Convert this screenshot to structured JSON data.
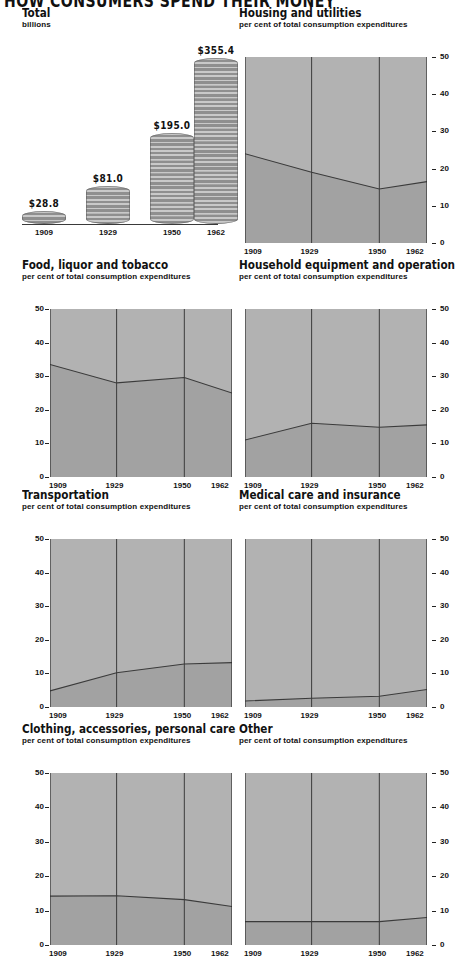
{
  "title": "HOW CONSUMERS SPEND THEIR MONEY",
  "colors": {
    "upper_area": "#b2b2b2",
    "lower_area": "#a2a2a2",
    "line": "#3b3b3b",
    "axis": "#2a2a2a",
    "coin_light": "#c9c9c9",
    "coin_dark": "#8f8f8f",
    "background": "#ffffff"
  },
  "axis": {
    "y_ticks": [
      "0",
      "10",
      "20",
      "30",
      "40",
      "50"
    ],
    "y_min": 0,
    "y_max": 50,
    "x_labels": [
      "1909",
      "1929",
      "1950",
      "1962"
    ],
    "subtitle": "per cent of total consumption expenditures"
  },
  "chart_data": [
    {
      "type": "bar",
      "title": "Total",
      "subtitle": "billions",
      "ylabel": "billions",
      "xlabel": "",
      "categories": [
        "1909",
        "1929",
        "1950",
        "1962"
      ],
      "values": [
        28.8,
        81.0,
        195.0,
        355.4
      ],
      "value_labels": [
        "$28.8",
        "$81.0",
        "$195.0",
        "$355.4"
      ],
      "ylim": [
        0,
        380
      ],
      "grid": false,
      "legend": "none",
      "style": "coin-stack"
    },
    {
      "type": "area",
      "title": "Housing and utilities",
      "subtitle": "per cent of total consumption expenditures",
      "xlabel": "",
      "ylabel": "per cent of total consumption expenditures",
      "x": [
        "1909",
        "1929",
        "1950",
        "1962"
      ],
      "values": [
        24.0,
        19.0,
        14.5,
        16.5
      ],
      "ylim": [
        0,
        50
      ],
      "yticks": [
        0,
        10,
        20,
        30,
        40,
        50
      ],
      "grid": true,
      "legend": "none",
      "axis_side": "right"
    },
    {
      "type": "area",
      "title": "Food, liquor and tobacco",
      "subtitle": "per cent of total consumption expenditures",
      "xlabel": "",
      "ylabel": "per cent of total consumption expenditures",
      "x": [
        "1909",
        "1929",
        "1950",
        "1962"
      ],
      "values": [
        33.5,
        28.0,
        29.6,
        25.0
      ],
      "ylim": [
        0,
        50
      ],
      "yticks": [
        0,
        10,
        20,
        30,
        40,
        50
      ],
      "grid": true,
      "legend": "none",
      "axis_side": "left"
    },
    {
      "type": "area",
      "title": "Household equipment and operation",
      "subtitle": "per cent of total consumption expenditures",
      "xlabel": "",
      "ylabel": "per cent of total consumption expenditures",
      "x": [
        "1909",
        "1929",
        "1950",
        "1962"
      ],
      "values": [
        11.0,
        16.0,
        14.8,
        15.5
      ],
      "ylim": [
        0,
        50
      ],
      "yticks": [
        0,
        10,
        20,
        30,
        40,
        50
      ],
      "grid": true,
      "legend": "none",
      "axis_side": "right"
    },
    {
      "type": "area",
      "title": "Transportation",
      "subtitle": "per cent of total consumption expenditures",
      "xlabel": "",
      "ylabel": "per cent of total consumption expenditures",
      "x": [
        "1909",
        "1929",
        "1950",
        "1962"
      ],
      "values": [
        4.8,
        10.2,
        12.8,
        13.2
      ],
      "ylim": [
        0,
        50
      ],
      "yticks": [
        0,
        10,
        20,
        30,
        40,
        50
      ],
      "grid": true,
      "legend": "none",
      "axis_side": "left"
    },
    {
      "type": "area",
      "title": "Medical care and insurance",
      "subtitle": "per cent of total consumption expenditures",
      "xlabel": "",
      "ylabel": "per cent of total consumption expenditures",
      "x": [
        "1909",
        "1929",
        "1950",
        "1962"
      ],
      "values": [
        1.8,
        2.6,
        3.2,
        5.2
      ],
      "ylim": [
        0,
        50
      ],
      "yticks": [
        0,
        10,
        20,
        30,
        40,
        50
      ],
      "grid": true,
      "legend": "none",
      "axis_side": "right"
    },
    {
      "type": "area",
      "title": "Clothing, accessories, personal care",
      "subtitle": "per cent of total consumption expenditures",
      "xlabel": "",
      "ylabel": "per cent of total consumption expenditures",
      "x": [
        "1909",
        "1929",
        "1950",
        "1962"
      ],
      "values": [
        14.2,
        14.3,
        13.2,
        11.2
      ],
      "ylim": [
        0,
        50
      ],
      "yticks": [
        0,
        10,
        20,
        30,
        40,
        50
      ],
      "grid": true,
      "legend": "none",
      "axis_side": "left"
    },
    {
      "type": "area",
      "title": "Other",
      "subtitle": "per cent of total consumption expenditures",
      "xlabel": "",
      "ylabel": "per cent of total consumption expenditures",
      "x": [
        "1909",
        "1929",
        "1950",
        "1962"
      ],
      "values": [
        6.8,
        6.8,
        6.8,
        8.0
      ],
      "ylim": [
        0,
        50
      ],
      "yticks": [
        0,
        10,
        20,
        30,
        40,
        50
      ],
      "grid": true,
      "legend": "none",
      "axis_side": "right"
    }
  ]
}
